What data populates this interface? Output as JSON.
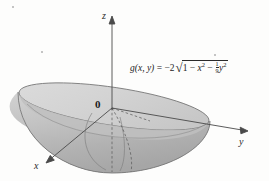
{
  "figure": {
    "name": "downward-half-ellipsoid-surface-plot",
    "background_color": "#fdfdfc"
  },
  "axes": {
    "z": {
      "label": "z",
      "direction": "up"
    },
    "y": {
      "label": "y",
      "direction": "right"
    },
    "x": {
      "label": "x",
      "direction": "down-left"
    },
    "origin": {
      "label": "0"
    },
    "axis_color": "#4a4a4a"
  },
  "formula": {
    "function_name": "g",
    "args": "(x, y)",
    "equals": "=",
    "coefficient": "−2",
    "radical_sign": "√",
    "radicand_terms": [
      "1",
      "−",
      "x",
      "−",
      "y"
    ],
    "first_term": "1",
    "minus_1": "−",
    "x_var": "x",
    "x_exp": "2",
    "minus_2": "−",
    "frac_num": "1",
    "frac_den": "9",
    "y_var": "y",
    "y_exp": "2",
    "plain_text": "g(x, y) = -2√(1 - x² - (1/9)y²)"
  },
  "surface": {
    "description": "Lower half of an ellipsoid (bowl opening downward) anchored at the origin",
    "rim_fill": "#cfcfcf",
    "rim_stroke": "#6e6e6e",
    "body_fill_light": "#c6c6c6",
    "body_fill_dark": "#aeaeae",
    "interior_fill": "#bdbdbd",
    "dashed_stroke": "#5e5e5e",
    "grid_stroke": "#7a7a7a"
  }
}
